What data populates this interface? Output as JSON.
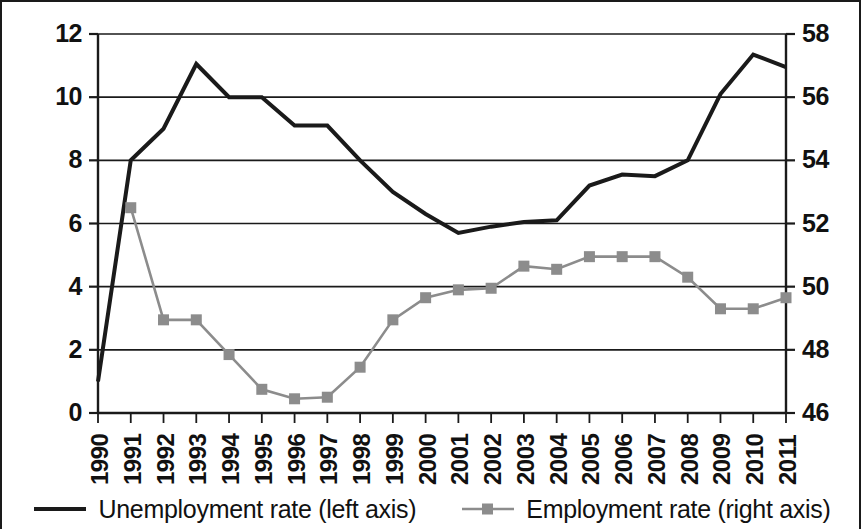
{
  "chart_data": {
    "type": "line",
    "title": "",
    "xlabel": "",
    "ylabel": "",
    "grid": true,
    "legend_position": "bottom",
    "x": [
      "1990",
      "1991",
      "1992",
      "1993",
      "1994",
      "1995",
      "1996",
      "1997",
      "1998",
      "1999",
      "2000",
      "2001",
      "2002",
      "2003",
      "2004",
      "2005",
      "2006",
      "2007",
      "2008",
      "2009",
      "2010",
      "2011"
    ],
    "categories": [
      "1990",
      "1991",
      "1992",
      "1993",
      "1994",
      "1995",
      "1996",
      "1997",
      "1998",
      "1999",
      "2000",
      "2001",
      "2002",
      "2003",
      "2004",
      "2005",
      "2006",
      "2007",
      "2008",
      "2009",
      "2010",
      "2011"
    ],
    "axes": {
      "left": {
        "label": "Unemployment rate (left axis)",
        "ticks": [
          "0",
          "2",
          "4",
          "6",
          "8",
          "10",
          "12"
        ],
        "tick_values": [
          0,
          2,
          4,
          6,
          8,
          10,
          12
        ],
        "ylim": [
          0,
          12
        ]
      },
      "right": {
        "label": "Employment rate (right axis)",
        "ticks": [
          "46",
          "48",
          "50",
          "52",
          "54",
          "56",
          "58"
        ],
        "tick_values": [
          46,
          48,
          50,
          52,
          54,
          56,
          58
        ],
        "ylim": [
          46,
          58
        ]
      }
    },
    "series": [
      {
        "name": "Unemployment rate (left axis)",
        "axis": "left",
        "color": "#1a1a1a",
        "marker": "none",
        "values": [
          1.0,
          8.0,
          9.0,
          11.05,
          10.0,
          10.0,
          9.1,
          9.1,
          8.0,
          7.0,
          6.3,
          5.7,
          5.9,
          6.05,
          6.1,
          7.2,
          7.55,
          7.5,
          8.0,
          10.1,
          11.35,
          10.95
        ]
      },
      {
        "name": "Employment rate (right axis)",
        "axis": "right",
        "color": "#8c8c8c",
        "marker": "square",
        "values": [
          null,
          52.5,
          48.95,
          48.95,
          47.85,
          46.75,
          46.45,
          46.5,
          47.45,
          48.95,
          49.65,
          49.9,
          49.95,
          50.65,
          50.55,
          50.95,
          50.95,
          50.95,
          50.3,
          49.3,
          49.3,
          49.65
        ]
      }
    ],
    "legend": [
      {
        "label": "Unemployment rate (left axis)",
        "color": "#1a1a1a",
        "marker": "none"
      },
      {
        "label": "Employment rate (right axis)",
        "color": "#8c8c8c",
        "marker": "square"
      }
    ]
  }
}
